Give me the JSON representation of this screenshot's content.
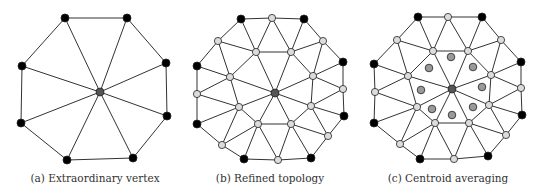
{
  "colors": {
    "edge": "#333333",
    "original_vertex": "#000000",
    "new_vertex": "#dcdcdc",
    "center_vertex": "#555555",
    "centroid": "#9a9a9a",
    "outline": "#222222"
  },
  "panels": [
    {
      "id": "a",
      "caption": "(a) Extraordinary vertex",
      "caption_x": 95,
      "center": [
        100,
        92
      ],
      "ring": [
        [
          65,
          18
        ],
        [
          127,
          18
        ],
        [
          166,
          63
        ],
        [
          167,
          116
        ],
        [
          133,
          158
        ],
        [
          67,
          160
        ],
        [
          21,
          123
        ],
        [
          22,
          66
        ]
      ],
      "refined": false,
      "centroids": []
    },
    {
      "id": "b",
      "caption": "(b) Refined topology",
      "caption_x": 270,
      "center": [
        275,
        93
      ],
      "ring": [
        [
          241,
          19
        ],
        [
          304,
          19
        ],
        [
          343,
          62
        ],
        [
          344,
          116
        ],
        [
          311,
          158
        ],
        [
          244,
          159
        ],
        [
          197,
          124
        ],
        [
          197,
          66
        ]
      ],
      "edge_mids": [
        [
          272,
          18
        ],
        [
          323,
          41
        ],
        [
          343,
          89
        ],
        [
          328,
          136
        ],
        [
          278,
          160
        ],
        [
          222,
          145
        ],
        [
          197,
          94
        ],
        [
          218,
          41
        ]
      ],
      "spoke_mids": [
        [
          256,
          52
        ],
        [
          291,
          52
        ],
        [
          313,
          76
        ],
        [
          311,
          106
        ],
        [
          291,
          124
        ],
        [
          258,
          124
        ],
        [
          239,
          107
        ],
        [
          230,
          77
        ]
      ],
      "refined": true,
      "centroids": []
    },
    {
      "id": "c",
      "caption": "(c) Centroid averaging",
      "caption_x": 448,
      "center": [
        452,
        89
      ],
      "ring": [
        [
          418,
          17
        ],
        [
          482,
          17
        ],
        [
          521,
          62
        ],
        [
          522,
          115
        ],
        [
          488,
          156
        ],
        [
          420,
          159
        ],
        [
          374,
          123
        ],
        [
          374,
          64
        ]
      ],
      "edge_mids": [
        [
          448,
          17
        ],
        [
          501,
          40
        ],
        [
          521,
          88
        ],
        [
          506,
          135
        ],
        [
          454,
          159
        ],
        [
          400,
          144
        ],
        [
          375,
          92
        ],
        [
          397,
          40
        ]
      ],
      "spoke_mids": [
        [
          433,
          51
        ],
        [
          468,
          51
        ],
        [
          491,
          75
        ],
        [
          489,
          105
        ],
        [
          469,
          123
        ],
        [
          435,
          123
        ],
        [
          417,
          107
        ],
        [
          408,
          76
        ]
      ],
      "refined": true,
      "centroids": [
        [
          451,
          57
        ],
        [
          473,
          67
        ],
        [
          482,
          87
        ],
        [
          473,
          107
        ],
        [
          452,
          115
        ],
        [
          432,
          109
        ],
        [
          421,
          90
        ],
        [
          429,
          68
        ]
      ]
    }
  ]
}
